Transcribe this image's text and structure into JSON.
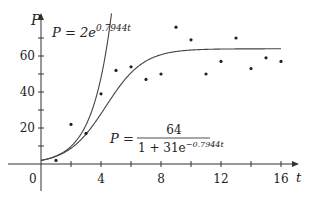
{
  "chart_data": {
    "type": "scatter",
    "title": "",
    "xlabel": "t",
    "ylabel": "P",
    "xlim": [
      -2.4,
      17.5
    ],
    "ylim": [
      -10,
      80
    ],
    "x_ticks": [
      0,
      4,
      8,
      12,
      16
    ],
    "x_tick_labels": [
      "0",
      "4",
      "8",
      "12",
      "16"
    ],
    "x_minor_ticks": [
      2,
      6,
      10,
      14
    ],
    "y_ticks": [
      20,
      40,
      60
    ],
    "y_tick_labels": [
      "20",
      "40",
      "60"
    ],
    "y_minor_ticks": [
      10,
      30,
      50,
      70
    ],
    "grid": false,
    "series": [
      {
        "name": "data",
        "kind": "scatter",
        "x": [
          1,
          2,
          3,
          4,
          5,
          6,
          7,
          8,
          9,
          10,
          11,
          12,
          13,
          14,
          15,
          16
        ],
        "y": [
          2,
          22,
          17,
          39,
          52,
          54,
          47,
          50,
          76,
          69,
          50,
          57,
          70,
          53,
          59,
          57
        ]
      },
      {
        "name": "P = 2e^{0.7944t}",
        "kind": "line",
        "formula": "2*exp(0.7944*t)",
        "t_range": [
          0,
          4.8
        ]
      },
      {
        "name": "P = 64 / (1 + 31e^{-0.7944t})",
        "kind": "line",
        "formula": "64/(1+31*exp(-0.7944*t))",
        "t_range": [
          0,
          16
        ]
      }
    ],
    "annotations": [
      {
        "text": "P = 2e^{0.7944t}",
        "near": "exponential curve, upper left"
      },
      {
        "text": "P = 64 / (1 + 31e^{-0.7944t})",
        "near": "logistic curve, center"
      }
    ]
  },
  "labels": {
    "axis_y": "P",
    "axis_x": "t",
    "origin": "0",
    "exp_lhs": "P = 2e",
    "exp_power": "0.7944t",
    "log_lhs": "P =",
    "log_num": "64",
    "log_den": "1 + 31e",
    "log_den_power": "−0.7944t"
  },
  "colors": {
    "axis": "#333333",
    "curve": "#444444",
    "point": "#222222"
  }
}
